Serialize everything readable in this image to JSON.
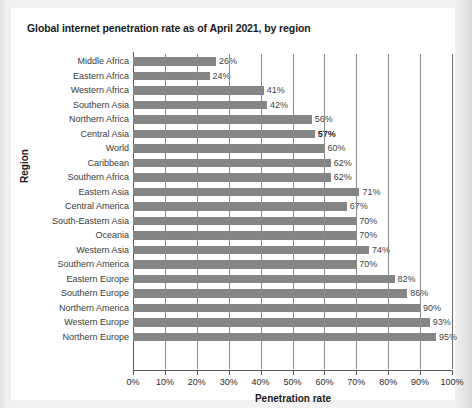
{
  "chart_data": {
    "type": "bar",
    "orientation": "horizontal",
    "title": "Global internet penetration rate as of April 2021, by region",
    "xlabel": "Penetration rate",
    "ylabel": "Region",
    "xlim": [
      0,
      100
    ],
    "grid": true,
    "legend": "none",
    "xticks": [
      "0%",
      "10%",
      "20%",
      "30%",
      "40%",
      "50%",
      "60%",
      "70%",
      "80%",
      "90%",
      "100%"
    ],
    "xtick_values": [
      0,
      10,
      20,
      30,
      40,
      50,
      60,
      70,
      80,
      90,
      100
    ],
    "value_suffix": "%",
    "bar_color": "#858585",
    "categories": [
      "Middle Africa",
      "Eastern Africa",
      "Western Africa",
      "Southern Asia",
      "Northern Africa",
      "Central Asia",
      "World",
      "Caribbean",
      "Southern Africa",
      "Eastern Asia",
      "Central America",
      "South-Eastern Asia",
      "Oceania",
      "Western Asia",
      "Southern America",
      "Eastern Europe",
      "Southern Europe",
      "Northern America",
      "Western Europe",
      "Northern Europe"
    ],
    "values": [
      26,
      24,
      41,
      42,
      56,
      57,
      60,
      62,
      62,
      71,
      67,
      70,
      70,
      74,
      70,
      82,
      86,
      90,
      93,
      95
    ],
    "data_labels": [
      "26%",
      "24%",
      "41%",
      "42%",
      "56%",
      "57%",
      "60%",
      "62%",
      "62%",
      "71%",
      "67%",
      "70%",
      "70%",
      "74%",
      "70%",
      "82%",
      "86%",
      "90%",
      "93%",
      "95%"
    ]
  }
}
